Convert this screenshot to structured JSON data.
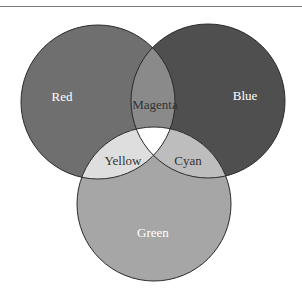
{
  "diagram": {
    "type": "venn",
    "sets": [
      {
        "name": "Red",
        "label": "Red",
        "cx": 98,
        "cy": 102,
        "r": 77,
        "color": "#6f6f6f",
        "text_color": "#ffffff",
        "label_x": 62,
        "label_y": 101
      },
      {
        "name": "Blue",
        "label": "Blue",
        "cx": 208,
        "cy": 101,
        "r": 77,
        "color": "#4f4f4f",
        "text_color": "#ffffff",
        "label_x": 245,
        "label_y": 100
      },
      {
        "name": "Green",
        "label": "Green",
        "cx": 154,
        "cy": 204,
        "r": 77,
        "color": "#a6a6a6",
        "text_color": "#ffffff",
        "label_x": 153,
        "label_y": 237
      }
    ],
    "intersections": [
      {
        "name": "Magenta",
        "label": "Magenta",
        "of": [
          "Red",
          "Blue"
        ],
        "color": "#8a8a8a",
        "text_color": "#333333",
        "label_x": 155,
        "label_y": 109
      },
      {
        "name": "Yellow",
        "label": "Yellow",
        "of": [
          "Red",
          "Green"
        ],
        "color": "#dedede",
        "text_color": "#333333",
        "label_x": 123,
        "label_y": 165
      },
      {
        "name": "Cyan",
        "label": "Cyan",
        "of": [
          "Blue",
          "Green"
        ],
        "color": "#bdbdbd",
        "text_color": "#333333",
        "label_x": 188,
        "label_y": 165
      },
      {
        "name": "White",
        "label": "",
        "of": [
          "Red",
          "Blue",
          "Green"
        ],
        "color": "#ffffff"
      }
    ]
  },
  "labels": {
    "red": "Red",
    "blue": "Blue",
    "green": "Green",
    "magenta": "Magenta",
    "yellow": "Yellow",
    "cyan": "Cyan"
  }
}
